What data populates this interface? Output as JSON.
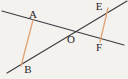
{
  "figure": {
    "width": 128,
    "height": 79,
    "background_color": "#f4f2ee",
    "line_color": "#3b3a42",
    "segment_color": "#e2a271",
    "label_color": "#25242a",
    "line_width": 1.1,
    "segment_width": 1.3,
    "labels": [
      {
        "text": "A",
        "x": 33,
        "y": 14
      },
      {
        "text": "B",
        "x": 28,
        "y": 69
      },
      {
        "text": "E",
        "x": 99,
        "y": 6
      },
      {
        "text": "O",
        "x": 71,
        "y": 39
      },
      {
        "text": "F",
        "x": 99,
        "y": 47
      }
    ],
    "lines": [
      {
        "name": "line-upper-left-to-lower-right",
        "x1": 2,
        "y1": 11,
        "x2": 124,
        "y2": 45
      },
      {
        "name": "line-lower-left-to-upper-right",
        "x1": 7,
        "y1": 73,
        "x2": 127,
        "y2": 1
      }
    ],
    "segments": [
      {
        "name": "segment-AB",
        "x1": 33,
        "y1": 20,
        "x2": 21,
        "y2": 66
      },
      {
        "name": "segment-EF",
        "x1": 108,
        "y1": 8,
        "x2": 100,
        "y2": 42
      }
    ],
    "points": [
      {
        "name": "point-A",
        "x": 33,
        "y": 20
      },
      {
        "name": "point-B",
        "x": 21,
        "y": 66
      },
      {
        "name": "point-E",
        "x": 108,
        "y": 8
      },
      {
        "name": "point-O",
        "x": 68,
        "y": 34
      },
      {
        "name": "point-F",
        "x": 100,
        "y": 42
      }
    ]
  }
}
